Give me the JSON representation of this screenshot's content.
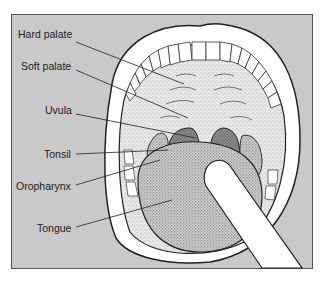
{
  "diagram": {
    "labels": [
      {
        "id": "hard-palate",
        "text": "Hard palate"
      },
      {
        "id": "soft-palate",
        "text": "Soft palate"
      },
      {
        "id": "uvula",
        "text": "Uvula"
      },
      {
        "id": "tonsil",
        "text": "Tonsil"
      },
      {
        "id": "oropharynx",
        "text": "Oropharynx"
      },
      {
        "id": "tongue",
        "text": "Tongue"
      }
    ],
    "colors": {
      "background_panel": "#c9c9c9",
      "outline": "#222222",
      "lip": "#ffffff",
      "stipple_light": "#e6e6e6",
      "stipple_dark": "#8a8a8a",
      "depressor": "#ffffff"
    }
  }
}
